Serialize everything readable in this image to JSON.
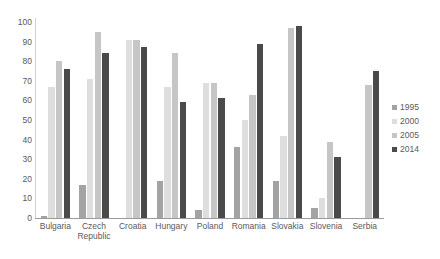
{
  "chart_data": {
    "type": "bar",
    "title": "",
    "subtitle": "",
    "xlabel": "",
    "ylabel": "",
    "ylim": [
      0,
      100
    ],
    "yticks": [
      100,
      90,
      80,
      70,
      60,
      50,
      40,
      30,
      20,
      10,
      0
    ],
    "grid": false,
    "legend_position": "right",
    "categories": [
      "Bulgaria",
      "Czech Republic",
      "Croatia",
      "Hungary",
      "Poland",
      "Romania",
      "Slovakia",
      "Slovenia",
      "Serbia"
    ],
    "series": [
      {
        "name": "1995",
        "color": "#a3a3a3",
        "values": [
          1,
          17,
          0,
          19,
          4,
          36,
          19,
          5,
          0
        ]
      },
      {
        "name": "2000",
        "color": "#dedede",
        "values": [
          67,
          71,
          91,
          67,
          69,
          50,
          42,
          10,
          0
        ]
      },
      {
        "name": "2005",
        "color": "#c6c6c6",
        "values": [
          80,
          95,
          91,
          84,
          69,
          63,
          97,
          39,
          68
        ]
      },
      {
        "name": "2014",
        "color": "#4a4a4a",
        "values": [
          76,
          84,
          87,
          59,
          61,
          89,
          98,
          31,
          75
        ]
      }
    ]
  },
  "legend": {
    "items": [
      {
        "label": "1995"
      },
      {
        "label": "2000"
      },
      {
        "label": "2005"
      },
      {
        "label": "2014"
      }
    ]
  },
  "axes": {
    "y": {
      "ticks": [
        "100",
        "90",
        "80",
        "70",
        "60",
        "50",
        "40",
        "30",
        "20",
        "10",
        "0"
      ]
    },
    "x": {
      "ticks": [
        "Bulgaria",
        "Czech Republic",
        "Croatia",
        "Hungary",
        "Poland",
        "Romania",
        "Slovakia",
        "Slovenia",
        "Serbia"
      ]
    }
  }
}
